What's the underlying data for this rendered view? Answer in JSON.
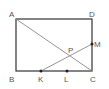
{
  "diagram": {
    "type": "geometry",
    "colors": {
      "rectangle": "#333333",
      "diagonal": "#888888",
      "segment": "#888888",
      "point": "#222222",
      "label": "#555555"
    },
    "points": {
      "A": {
        "label": "A",
        "x": 16,
        "y": 19
      },
      "B": {
        "label": "B",
        "x": 16,
        "y": 71
      },
      "C": {
        "label": "C",
        "x": 92,
        "y": 71
      },
      "D": {
        "label": "D",
        "x": 92,
        "y": 19
      },
      "K": {
        "label": "K",
        "x": 41,
        "y": 71
      },
      "L": {
        "label": "L",
        "x": 67,
        "y": 71
      },
      "M": {
        "label": "M",
        "x": 92,
        "y": 44
      },
      "P": {
        "label": "P",
        "x": 71,
        "y": 55
      }
    },
    "segments": [
      {
        "from": "A",
        "to": "D"
      },
      {
        "from": "D",
        "to": "C"
      },
      {
        "from": "C",
        "to": "B"
      },
      {
        "from": "B",
        "to": "A"
      },
      {
        "from": "A",
        "to": "C"
      },
      {
        "from": "K",
        "to": "M"
      }
    ],
    "marked_points": [
      "K",
      "L",
      "M"
    ]
  }
}
